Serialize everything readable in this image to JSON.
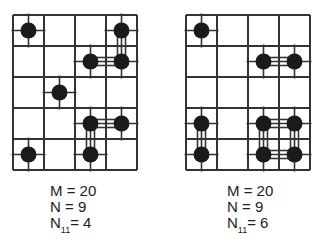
{
  "panels": [
    {
      "name": "left",
      "rows": 5,
      "cols": 4,
      "dots": [
        [
          0,
          0
        ],
        [
          0,
          3
        ],
        [
          1,
          2
        ],
        [
          1,
          3
        ],
        [
          2,
          1
        ],
        [
          3,
          2
        ],
        [
          3,
          3
        ],
        [
          4,
          0
        ],
        [
          4,
          2
        ]
      ],
      "links": [
        [
          [
            0,
            3
          ],
          [
            1,
            3
          ]
        ],
        [
          [
            1,
            2
          ],
          [
            1,
            3
          ]
        ],
        [
          [
            3,
            2
          ],
          [
            3,
            3
          ]
        ],
        [
          [
            3,
            2
          ],
          [
            4,
            2
          ]
        ]
      ],
      "caption": {
        "m_label": "M = 20",
        "n_label": "N = 9",
        "n11_main": "N",
        "n11_sub": "11",
        "n11_value": "= 4"
      }
    },
    {
      "name": "right",
      "rows": 5,
      "cols": 4,
      "dots": [
        [
          0,
          0
        ],
        [
          1,
          2
        ],
        [
          1,
          3
        ],
        [
          3,
          0
        ],
        [
          3,
          2
        ],
        [
          3,
          3
        ],
        [
          4,
          0
        ],
        [
          4,
          2
        ],
        [
          4,
          3
        ]
      ],
      "links": [
        [
          [
            1,
            2
          ],
          [
            1,
            3
          ]
        ],
        [
          [
            3,
            0
          ],
          [
            4,
            0
          ]
        ],
        [
          [
            3,
            2
          ],
          [
            3,
            3
          ]
        ],
        [
          [
            3,
            2
          ],
          [
            4,
            2
          ]
        ],
        [
          [
            3,
            3
          ],
          [
            4,
            3
          ]
        ],
        [
          [
            4,
            2
          ],
          [
            4,
            3
          ]
        ]
      ],
      "caption": {
        "m_label": "M = 20",
        "n_label": "N = 9",
        "n11_main": "N",
        "n11_sub": "11",
        "n11_value": "= 6"
      }
    }
  ]
}
